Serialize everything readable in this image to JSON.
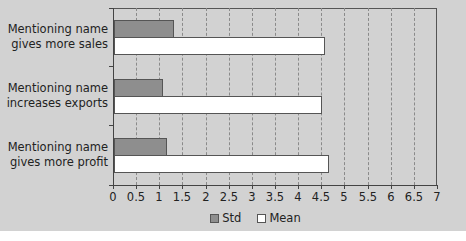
{
  "chart_data": {
    "type": "bar",
    "orientation": "horizontal",
    "title": "",
    "xlabel": "",
    "ylabel": "",
    "categories": [
      "Mentioning name gives more sales",
      "Mentioning name increases exports",
      "Mentioning name gives more profit"
    ],
    "category_lines": [
      [
        "Mentioning name",
        "gives more sales"
      ],
      [
        "Mentioning name",
        "increases exports"
      ],
      [
        "Mentioning name",
        "gives more profit"
      ]
    ],
    "series": [
      {
        "name": "Std",
        "color": "#8e8e8e",
        "values": [
          1.3,
          1.05,
          1.15
        ]
      },
      {
        "name": "Mean",
        "color": "#ffffff",
        "values": [
          4.55,
          4.5,
          4.65
        ]
      }
    ],
    "xlim": [
      0,
      7
    ],
    "x_ticks": [
      "0",
      "0.5",
      "1",
      "1.5",
      "2",
      "2.5",
      "3",
      "3.5",
      "4",
      "4.5",
      "5",
      "5.5",
      "6",
      "6.5",
      "7"
    ],
    "grid": "vertical dashed",
    "legend_position": "bottom"
  },
  "legend": {
    "std_label": "Std",
    "mean_label": "Mean"
  },
  "colors": {
    "panel_bg": "#d2d2d2",
    "std_fill": "#8e8e8e",
    "mean_fill": "#ffffff"
  }
}
